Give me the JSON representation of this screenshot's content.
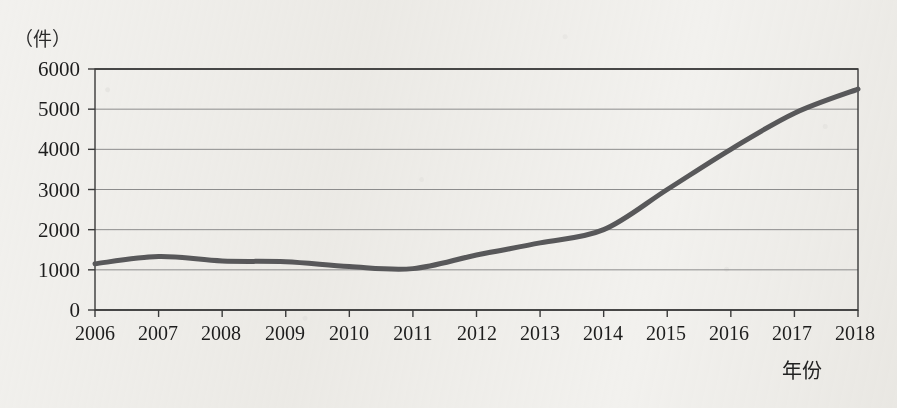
{
  "chart_data": {
    "type": "line",
    "title": "",
    "subtitle": "",
    "xlabel": "年份",
    "ylabel": "（件）",
    "ylabel_note": "unit label shown at top-left of y-axis",
    "categories": [
      "2006",
      "2007",
      "2008",
      "2009",
      "2010",
      "2011",
      "2012",
      "2013",
      "2014",
      "2015",
      "2016",
      "2017",
      "2018"
    ],
    "x": [
      2006,
      2007,
      2008,
      2009,
      2010,
      2011,
      2012,
      2013,
      2014,
      2015,
      2016,
      2017,
      2018
    ],
    "values": [
      1150,
      1330,
      1220,
      1200,
      1080,
      1030,
      1370,
      1670,
      2000,
      3000,
      4000,
      4900,
      5500
    ],
    "series": [
      {
        "name": "",
        "values": [
          1150,
          1330,
          1220,
          1200,
          1080,
          1030,
          1370,
          1670,
          2000,
          3000,
          4000,
          4900,
          5500
        ]
      }
    ],
    "ylim": [
      0,
      6000
    ],
    "yticks": [
      0,
      1000,
      2000,
      3000,
      4000,
      5000,
      6000
    ],
    "ytick_labels": [
      "0",
      "1000",
      "2000",
      "3000",
      "4000",
      "5000",
      "6000"
    ],
    "xlim": [
      2006,
      2018
    ],
    "grid": "horizontal",
    "legend": "none",
    "line_color": "#58585a",
    "line_width": 5,
    "smooth": true,
    "markers": false,
    "plot_border": true,
    "background_color": "#f2f1ee",
    "axis_color": "#3a3a3a",
    "grid_color": "#8c8c8c"
  },
  "axis": {
    "y_unit_label": "（件）",
    "x_axis_title": "年份"
  }
}
